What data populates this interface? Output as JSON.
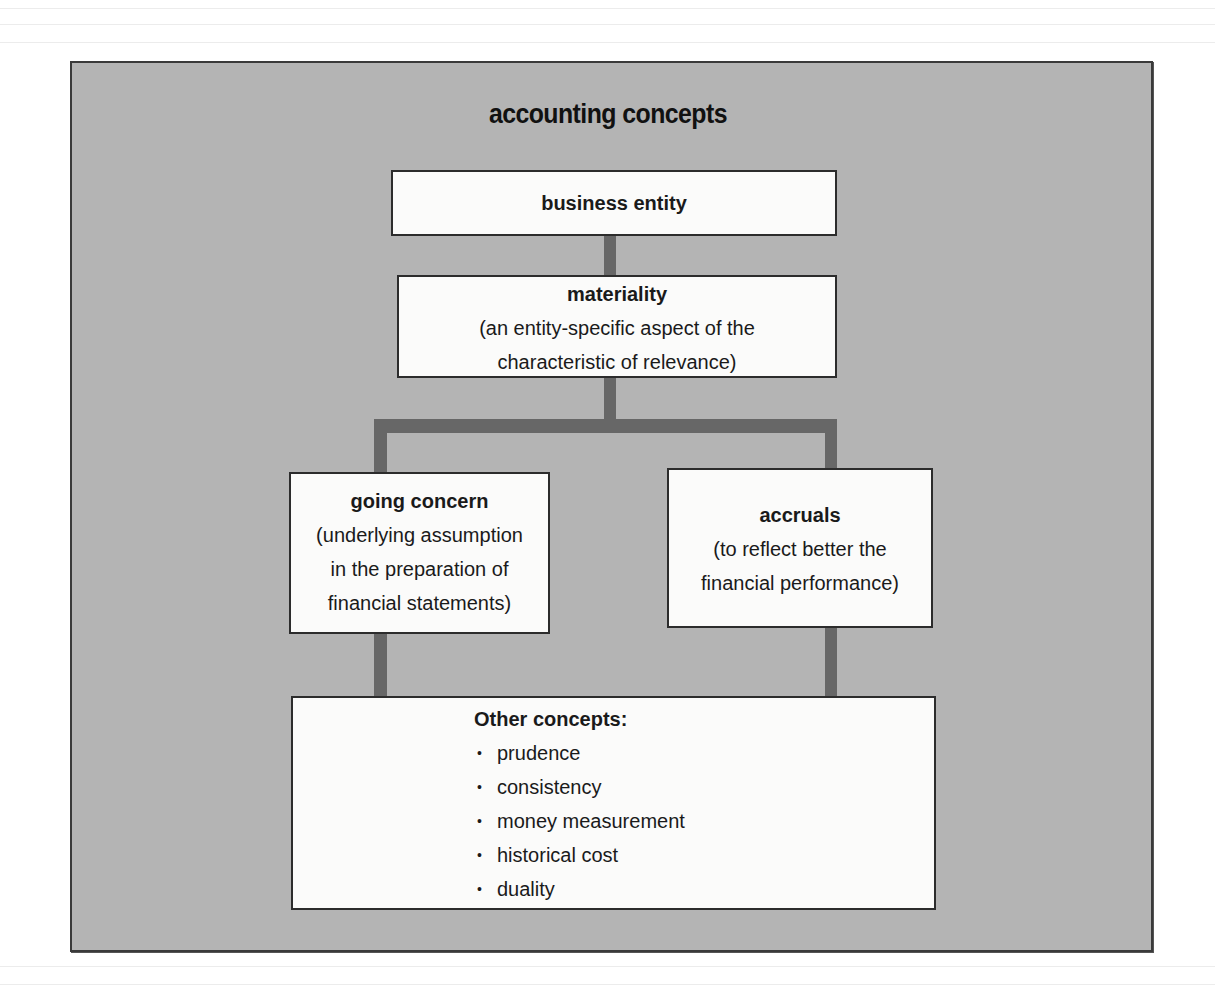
{
  "diagram": {
    "title": "accounting concepts",
    "colors": {
      "panel_background": "#b4b4b4",
      "box_background": "#fbfbfa",
      "connector": "#676767",
      "border": "#2c2c2c",
      "text": "#151515"
    },
    "nodes": {
      "business_entity": {
        "heading": "business entity"
      },
      "materiality": {
        "heading": "materiality",
        "lines": [
          "(an entity-specific aspect of the",
          "characteristic of relevance)"
        ]
      },
      "going_concern": {
        "heading": "going concern",
        "lines": [
          "(underlying assumption",
          "in the preparation of",
          "financial statements)"
        ]
      },
      "accruals": {
        "heading": "accruals",
        "lines": [
          "(to reflect better the",
          "financial performance)"
        ]
      },
      "other_concepts": {
        "heading": "Other concepts:",
        "bullet": "•",
        "items": [
          "prudence",
          "consistency",
          "money measurement",
          "historical cost",
          "duality"
        ]
      }
    },
    "edges": [
      {
        "from": "business_entity",
        "to": "materiality"
      },
      {
        "from": "materiality",
        "to": "going_concern"
      },
      {
        "from": "materiality",
        "to": "accruals"
      },
      {
        "from": "going_concern",
        "to": "other_concepts"
      },
      {
        "from": "accruals",
        "to": "other_concepts"
      }
    ]
  }
}
